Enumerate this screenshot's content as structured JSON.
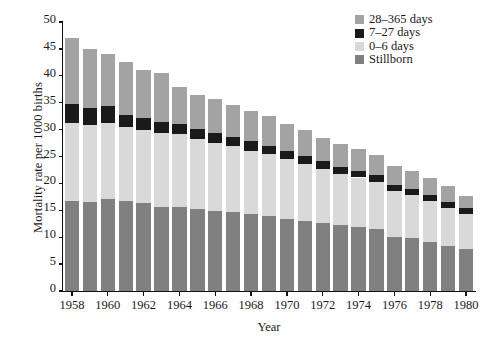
{
  "chart_data": {
    "type": "bar",
    "subtype": "stacked-bar",
    "title": "",
    "xlabel": "Year",
    "ylabel": "Mortality rate per 1000 births",
    "ylim": [
      0,
      50
    ],
    "ytick_step": 5,
    "yticks": [
      "0",
      "5",
      "10",
      "15",
      "20",
      "25",
      "30",
      "35",
      "40",
      "45",
      "50"
    ],
    "grid": false,
    "legend_position": "top-right",
    "categories": [
      "1958",
      "1959",
      "1960",
      "1961",
      "1962",
      "1963",
      "1964",
      "1965",
      "1966",
      "1967",
      "1968",
      "1969",
      "1970",
      "1971",
      "1972",
      "1973",
      "1974",
      "1975",
      "1976",
      "1977",
      "1978",
      "1979",
      "1980"
    ],
    "xtick_labels": [
      "1958",
      "1960",
      "1962",
      "1964",
      "1966",
      "1968",
      "1970",
      "1972",
      "1974",
      "1976",
      "1978",
      "1980"
    ],
    "xtick_categories": [
      "1958",
      "1960",
      "1962",
      "1964",
      "1966",
      "1968",
      "1970",
      "1972",
      "1974",
      "1976",
      "1978",
      "1980"
    ],
    "series": [
      {
        "name": "Stillborn",
        "color": "#808080",
        "values": [
          16.7,
          16.6,
          17.1,
          16.7,
          16.3,
          15.6,
          15.7,
          15.2,
          14.9,
          14.6,
          14.4,
          13.9,
          13.4,
          13.0,
          12.6,
          12.2,
          11.9,
          11.5,
          10.0,
          9.8,
          9.2,
          8.4,
          7.8
        ]
      },
      {
        "name": "0–6 days",
        "color": "#d9d9d9",
        "values": [
          14.6,
          14.2,
          14.2,
          13.8,
          13.7,
          13.8,
          13.4,
          13.1,
          12.7,
          12.3,
          11.7,
          11.5,
          11.1,
          10.7,
          10.1,
          9.6,
          9.2,
          8.8,
          8.5,
          8.1,
          7.6,
          7.1,
          6.6
        ]
      },
      {
        "name": "7–27 days",
        "color": "#1a1a1a",
        "values": [
          3.4,
          3.2,
          3.0,
          2.3,
          2.2,
          2.0,
          1.9,
          1.8,
          1.8,
          1.7,
          1.7,
          1.5,
          1.5,
          1.4,
          1.4,
          1.3,
          1.3,
          1.2,
          1.2,
          1.1,
          1.1,
          1.0,
          1.0
        ]
      },
      {
        "name": "28–365 days",
        "color": "#a3a3a3",
        "values": [
          12.3,
          11.0,
          9.7,
          9.7,
          8.9,
          9.2,
          7.0,
          6.4,
          6.2,
          5.9,
          5.7,
          5.6,
          5.1,
          4.9,
          4.4,
          4.2,
          4.0,
          3.8,
          3.6,
          3.4,
          3.2,
          3.0,
          2.3
        ]
      }
    ],
    "stack_order_bottom_to_top": [
      "Stillborn",
      "0–6 days",
      "7–27 days",
      "28–365 days"
    ],
    "totals": [
      47.0,
      45.0,
      44.0,
      42.5,
      41.1,
      40.6,
      38.0,
      36.5,
      35.6,
      34.5,
      33.5,
      32.5,
      31.1,
      30.0,
      28.5,
      27.3,
      26.4,
      25.3,
      23.3,
      22.4,
      21.1,
      19.5,
      17.7
    ],
    "legend_entries": [
      {
        "label": "28–365 days",
        "color": "#a3a3a3"
      },
      {
        "label": "7–27 days",
        "color": "#1a1a1a"
      },
      {
        "label": "0–6 days",
        "color": "#d9d9d9"
      },
      {
        "label": "Stillborn",
        "color": "#808080"
      }
    ]
  }
}
